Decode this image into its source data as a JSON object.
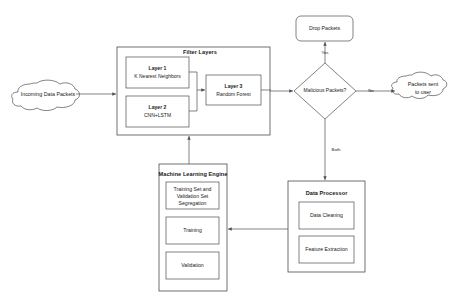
{
  "diagram": {
    "type": "flowchart",
    "background_color": "#ffffff",
    "stroke_color": "#4d4d4d",
    "text_color": "#1a1a1a"
  },
  "nodes": {
    "incoming_packets": {
      "label": "Incoming Data Packets",
      "shape": "cloud"
    },
    "filter_layers": {
      "label": "Filter Layers",
      "shape": "rectangle",
      "children": {
        "layer1": {
          "title": "Layer 1",
          "subtitle": "K Nearest Neighbors",
          "shape": "rectangle"
        },
        "layer2": {
          "title": "Layer 2",
          "subtitle": "CNN+LSTM",
          "shape": "rectangle"
        },
        "layer3": {
          "title": "Layer 3",
          "subtitle": "Random Forest",
          "shape": "rectangle"
        }
      }
    },
    "decision": {
      "label": "Malicious Packets?",
      "shape": "diamond"
    },
    "drop_packets": {
      "label": "Drop Packets",
      "shape": "rounded-rectangle"
    },
    "packets_sent": {
      "label_line1": "Packets sent",
      "label_line2": "to user",
      "shape": "cloud"
    },
    "data_processor": {
      "label": "Data Processor",
      "shape": "rectangle",
      "children": {
        "data_cleaning": {
          "label": "Data Cleaning",
          "shape": "rectangle"
        },
        "feature_extraction": {
          "label": "Feature Extraction",
          "shape": "rectangle"
        }
      }
    },
    "ml_engine": {
      "label": "Machine Learning Engine",
      "shape": "rectangle",
      "children": {
        "segregation": {
          "line1": "Training Set and",
          "line2": "Validation Set",
          "line3": "Segregation",
          "shape": "rectangle"
        },
        "training": {
          "label": "Training",
          "shape": "rectangle"
        },
        "validation": {
          "label": "Validation",
          "shape": "rectangle"
        }
      }
    }
  },
  "edges": {
    "incoming_to_filter": {
      "label": ""
    },
    "layer1_to_layer3": {
      "label": ""
    },
    "layer2_to_layer3": {
      "label": ""
    },
    "filter_to_decision": {
      "label": ""
    },
    "decision_yes": {
      "label": "Yes"
    },
    "decision_no": {
      "label": "No"
    },
    "decision_both": {
      "label": "Both"
    },
    "processor_to_ml": {
      "label": ""
    },
    "ml_to_filter": {
      "label": ""
    }
  }
}
